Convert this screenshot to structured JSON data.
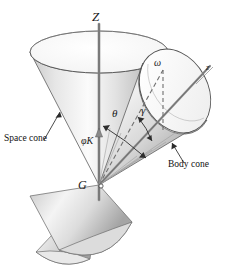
{
  "figure": {
    "background_color": "#ffffff",
    "line_color": "#555555",
    "label_color": "#1a1a1a"
  },
  "labels": {
    "axis_Z": "Z",
    "axis_z": "z",
    "omega": "ω",
    "theta": "θ",
    "gamma": "γ",
    "phi_k": "φK",
    "mass_center": "G",
    "space_cone": "Space cone",
    "body_cone": "Body cone"
  },
  "callouts": [
    {
      "name": "space-cone-callout",
      "text": "Space cone"
    },
    {
      "name": "body-cone-callout",
      "text": "Body cone"
    }
  ],
  "geometry": {
    "apex": {
      "x": 99,
      "y": 185
    },
    "omega_point": {
      "x": 163,
      "y": 70
    },
    "Z_axis_top": {
      "x": 99,
      "y": 24
    },
    "Z_axis_bottom": {
      "x": 99,
      "y": 200
    },
    "body_axis_end": {
      "x": 210,
      "y": 66
    },
    "space_cone_half_angle_deg": 26,
    "body_cone_half_angle_deg": 17,
    "precession_angle_label": "θ",
    "spin_angle_label": "γ"
  },
  "colors": {
    "cone_light": "#fdfdfd",
    "cone_mid": "#d9d9d9",
    "cone_dark": "#a8a8a8",
    "cone_shadow": "#8f8f8f",
    "outline": "#5a5a5a",
    "dashed": "#7a7a7a",
    "text": "#1a1a1a"
  }
}
